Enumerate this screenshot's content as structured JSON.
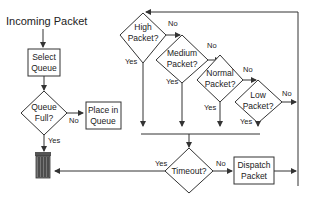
{
  "diagram": {
    "start_label": "Incoming Packet",
    "nodes": {
      "select_queue": [
        "Select",
        "Queue"
      ],
      "queue_full": [
        "Queue",
        "Full?"
      ],
      "place_in_queue": [
        "Place in",
        "Queue"
      ],
      "high_packet": [
        "High",
        "Packet?"
      ],
      "medium_packet": [
        "Medium",
        "Packet?"
      ],
      "normal_packet": [
        "Normal",
        "Packet?"
      ],
      "low_packet": [
        "Low",
        "Packet?"
      ],
      "timeout": "Timeout?",
      "dispatch_packet": [
        "Dispatch",
        "Packet"
      ]
    },
    "edges": {
      "queue_full_no": "No",
      "queue_full_yes": "Yes",
      "high_no": "No",
      "high_yes": "Yes",
      "medium_no": "No",
      "medium_yes": "Yes",
      "normal_no": "No",
      "normal_yes": "Yes",
      "low_no": "No",
      "low_yes": "Yes",
      "timeout_yes": "Yes",
      "timeout_no": "No"
    },
    "icons": {
      "discard": "trash-can-icon"
    }
  }
}
